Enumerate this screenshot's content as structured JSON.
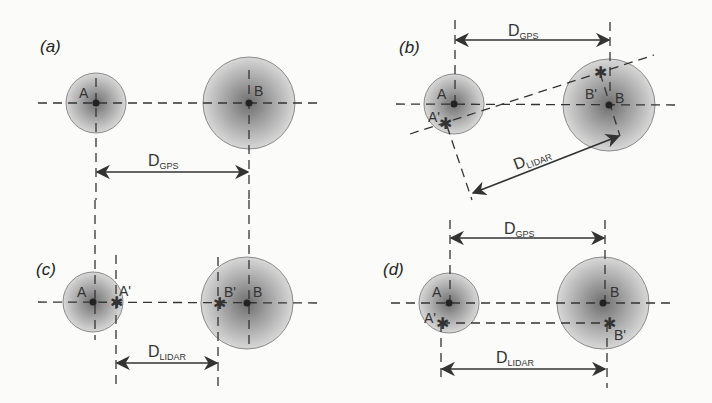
{
  "figure": {
    "panels": [
      {
        "id": "a",
        "label": "(a)",
        "points": {
          "A": "A",
          "B": "B"
        },
        "distances": [
          {
            "main": "D",
            "sub": "GPS"
          }
        ]
      },
      {
        "id": "b",
        "label": "(b)",
        "points": {
          "A": "A",
          "B": "B",
          "A_prime": "A'",
          "B_prime": "B'"
        },
        "distances": [
          {
            "main": "D",
            "sub": "GPS"
          },
          {
            "main": "D",
            "sub": "LIDAR"
          }
        ]
      },
      {
        "id": "c",
        "label": "(c)",
        "points": {
          "A": "A",
          "B": "B",
          "A_prime": "A'",
          "B_prime": "B'"
        },
        "distances": [
          {
            "main": "D",
            "sub": "LIDAR"
          }
        ]
      },
      {
        "id": "d",
        "label": "(d)",
        "points": {
          "A": "A",
          "B": "B",
          "A_prime": "A'",
          "B_prime": "B'"
        },
        "distances": [
          {
            "main": "D",
            "sub": "GPS"
          },
          {
            "main": "D",
            "sub": "LIDAR"
          }
        ]
      }
    ],
    "colors": {
      "background": "#fbfbfa",
      "ink": "#333333",
      "circle_center": "#7a7a7a",
      "circle_edge": "#d4d4d4"
    }
  }
}
